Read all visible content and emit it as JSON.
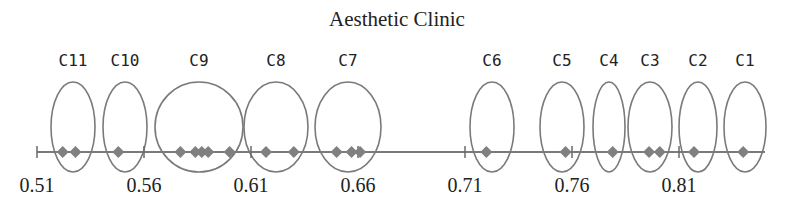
{
  "title": "Aesthetic Clinic",
  "chart_data": {
    "type": "scatter",
    "title": "Aesthetic Clinic",
    "xlabel": "",
    "ylabel": "",
    "x_ticks": [
      0.51,
      0.56,
      0.61,
      0.66,
      0.71,
      0.76,
      0.81
    ],
    "x_range": [
      0.51,
      0.84
    ],
    "grid": false,
    "clusters": [
      {
        "name": "C11",
        "values": [
          0.522,
          0.528
        ]
      },
      {
        "name": "C10",
        "values": [
          0.548
        ]
      },
      {
        "name": "C9",
        "values": [
          0.577,
          0.584,
          0.587,
          0.59,
          0.6
        ]
      },
      {
        "name": "C8",
        "values": [
          0.617,
          0.63
        ]
      },
      {
        "name": "C7",
        "values": [
          0.65,
          0.657,
          0.661
        ]
      },
      {
        "name": "C6",
        "values": [
          0.72
        ]
      },
      {
        "name": "C5",
        "values": [
          0.757
        ]
      },
      {
        "name": "C4",
        "values": [
          0.779
        ]
      },
      {
        "name": "C3",
        "values": [
          0.796,
          0.801
        ]
      },
      {
        "name": "C2",
        "values": [
          0.817
        ]
      },
      {
        "name": "C1",
        "values": [
          0.84
        ]
      }
    ]
  },
  "layout": {
    "axis_y": 152,
    "x0_px": 37,
    "x0_val": 0.51,
    "px_per_unit": 2140,
    "axis_end_px": 765,
    "ellipse_top": 82,
    "ellipse_bottom": 172,
    "label_y": 66,
    "tick_label_y": 192,
    "ellipses": [
      {
        "name": "C11",
        "cx": 73,
        "rx": 22
      },
      {
        "name": "C10",
        "cx": 125,
        "rx": 22
      },
      {
        "name": "C9",
        "cx": 199,
        "rx": 44
      },
      {
        "name": "C8",
        "cx": 276,
        "rx": 32
      },
      {
        "name": "C7",
        "cx": 348,
        "rx": 33
      },
      {
        "name": "C6",
        "cx": 492,
        "rx": 22
      },
      {
        "name": "C5",
        "cx": 562,
        "rx": 22
      },
      {
        "name": "C4",
        "cx": 609,
        "rx": 16
      },
      {
        "name": "C3",
        "cx": 650,
        "rx": 22
      },
      {
        "name": "C2",
        "cx": 698,
        "rx": 19
      },
      {
        "name": "C1",
        "cx": 745,
        "rx": 21
      }
    ]
  },
  "colors": {
    "axis": "#7a7a7a",
    "diamond": "#808080",
    "ellipse": "#7a7a7a",
    "text": "#222222"
  }
}
